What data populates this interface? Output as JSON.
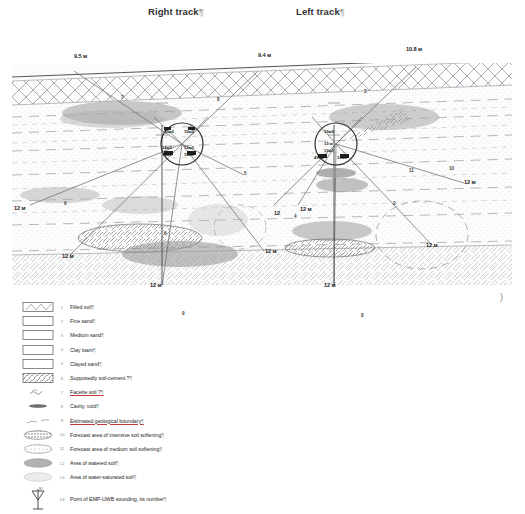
{
  "header": {
    "tracks": [
      {
        "label": "Right track",
        "mark": "¶"
      },
      {
        "label": "Left track",
        "mark": "¶"
      }
    ]
  },
  "figure": {
    "surface_depth_labels": [
      {
        "text": "9.5 м",
        "x": 62,
        "y": 4
      },
      {
        "text": "9.4 м",
        "x": 246,
        "y": 4
      },
      {
        "text": "10.8 м",
        "x": 398,
        "y": -5
      }
    ],
    "edge_depth_labels": [
      {
        "text": "12 м",
        "x": 6,
        "y": 155
      },
      {
        "text": "12 м",
        "x": 53,
        "y": 203
      },
      {
        "text": "12 м",
        "x": 139,
        "y": 232
      },
      {
        "text": "12 м",
        "x": 258,
        "y": 198
      },
      {
        "text": "12 м",
        "x": 290,
        "y": 156
      },
      {
        "text": "12 м",
        "x": 313,
        "y": 232
      },
      {
        "text": "12 м",
        "x": 452,
        "y": 130
      },
      {
        "text": "12 м",
        "x": 413,
        "y": 192
      }
    ],
    "ray_number_labels": [
      {
        "text": "7",
        "x": 109,
        "y": 42
      },
      {
        "text": "9",
        "x": 52,
        "y": 148
      },
      {
        "text": "5",
        "x": 232,
        "y": 118
      },
      {
        "text": "8",
        "x": 205,
        "y": 44
      },
      {
        "text": "6",
        "x": 152,
        "y": 178
      },
      {
        "text": "4",
        "x": 282,
        "y": 161
      },
      {
        "text": "11",
        "x": 397,
        "y": 115
      },
      {
        "text": "10",
        "x": 437,
        "y": 113
      },
      {
        "text": "3",
        "x": 352,
        "y": 36
      },
      {
        "text": "2",
        "x": 381,
        "y": 148
      },
      {
        "text": "9",
        "x": 170,
        "y": 258
      },
      {
        "text": "8",
        "x": 349,
        "y": 260
      },
      {
        "text": "12",
        "x": 267,
        "y": 240
      }
    ],
    "sounding_points": [
      {
        "id": "right-track-node",
        "cx": 170,
        "cy": 89,
        "r": 21,
        "labels": [
          {
            "text": "15м3",
            "x": 154,
            "y": 76
          },
          {
            "text": "15м3",
            "x": 173,
            "y": 76
          },
          {
            "text": "14м3",
            "x": 152,
            "y": 92
          },
          {
            "text": "13м3",
            "x": 174,
            "y": 92
          },
          {
            "text": "15м1",
            "x": 152,
            "y": 99
          },
          {
            "text": "15м3",
            "x": 174,
            "y": 99
          }
        ]
      },
      {
        "id": "left-track-node",
        "cx": 324,
        "cy": 89,
        "r": 21,
        "labels": [
          {
            "text": "13м3",
            "x": 314,
            "y": 76
          },
          {
            "text": "13 м",
            "x": 314,
            "y": 89
          },
          {
            "text": "13м1",
            "x": 314,
            "y": 96
          },
          {
            "text": "47м3",
            "x": 305,
            "y": 103
          },
          {
            "text": "13м3",
            "x": 327,
            "y": 103
          }
        ]
      }
    ]
  },
  "legend": {
    "items": [
      {
        "num": "1",
        "label": "Filled soil",
        "mark": "¶",
        "swatch": "box-filled-soil",
        "underline": false
      },
      {
        "num": "2",
        "label": "Fine sand",
        "mark": "¶",
        "swatch": "box-plain",
        "underline": false
      },
      {
        "num": "3",
        "label": "Medium sand",
        "mark": "¶",
        "swatch": "box-plain",
        "underline": false
      },
      {
        "num": "4",
        "label": "Clay loam",
        "mark": "¶",
        "swatch": "box-plain",
        "underline": false
      },
      {
        "num": "5",
        "label": "Clayed sand",
        "mark": "¶",
        "swatch": "box-plain",
        "underline": false
      },
      {
        "num": "6",
        "label": "Supposedly soil-cement ?",
        "mark": "¶",
        "swatch": "box-hatch",
        "underline": false
      },
      {
        "num": "7",
        "label": "Facette soil ?",
        "mark": "¶",
        "swatch": "squiggle",
        "underline": true
      },
      {
        "num": "8",
        "label": "Cavity, void",
        "mark": "¶",
        "swatch": "cavity",
        "underline": false
      },
      {
        "num": "9",
        "label": "Estimated geological boundary",
        "mark": "¶",
        "swatch": "dashline",
        "underline": true
      },
      {
        "num": "10",
        "label": "Forecast area of intensive soil softening",
        "mark": "¶",
        "swatch": "ellipse-dark",
        "underline": false
      },
      {
        "num": "11",
        "label": "Forecast area of medium soil softening",
        "mark": "¶",
        "swatch": "ellipse-mid",
        "underline": false
      },
      {
        "num": "12",
        "label": "Area of watered soil",
        "mark": "¶",
        "swatch": "ellipse-gray",
        "underline": false
      },
      {
        "num": "13",
        "label": "Area of water-saturated soil",
        "mark": "¶",
        "swatch": "ellipse-light",
        "underline": false
      },
      {
        "num": "14",
        "label": "Point of EMP-UWB sounding, its number",
        "mark": "¶",
        "swatch": "sounding-point",
        "underline": false
      }
    ]
  },
  "colors": {
    "ink": "#2b2b2b",
    "hatch": "#9aa0a6",
    "soil_dark": "#8d8d8d",
    "soil_mid": "#b4b4b4",
    "soil_light": "#d8d8d8",
    "surface_line": "#555555"
  },
  "stray_mark": ")"
}
